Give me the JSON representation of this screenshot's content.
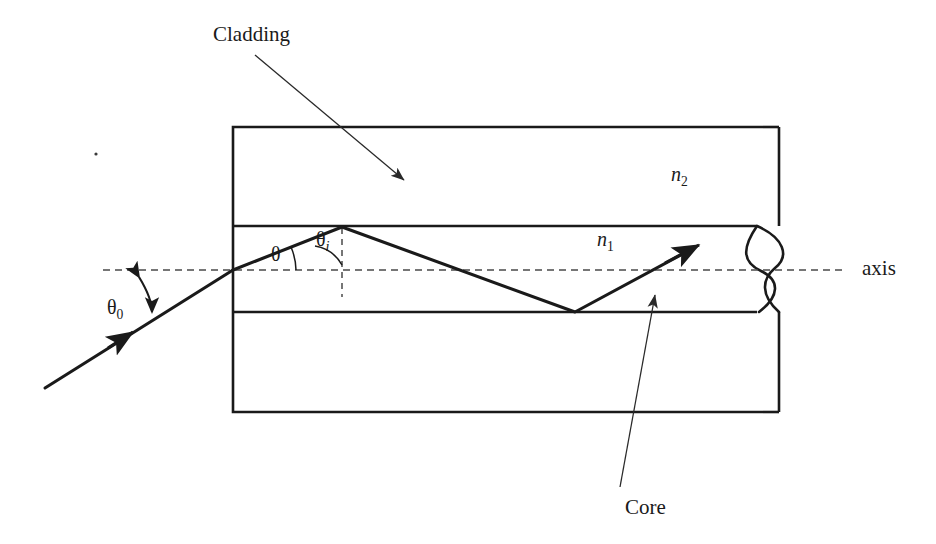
{
  "figure": {
    "type": "diagram",
    "background_color": "#ffffff",
    "line_color": "#1a1a1a",
    "dash_color": "#555555"
  },
  "labels": {
    "cladding": "Cladding",
    "core": "Core",
    "axis": "axis",
    "n2": "n",
    "n2_sub": "2",
    "n1": "n",
    "n1_sub": "1",
    "theta": "θ",
    "theta_i": "θ",
    "theta_i_sub": "i",
    "theta_0": "θ",
    "theta_0_sub": "0"
  },
  "geometry": {
    "cladding_rect": {
      "x": 233,
      "y": 127,
      "width": 703,
      "height": 285
    },
    "core_rect": {
      "x": 233,
      "y": 226,
      "width": 703,
      "height": 86
    },
    "axis_line": {
      "x1": 103,
      "y1": 270,
      "x2": 845,
      "y2": 270,
      "style": "dashed"
    },
    "normal_line": {
      "x1": 342,
      "y1": 228,
      "x2": 342,
      "y2": 297,
      "style": "dashed"
    },
    "incident_ray": {
      "x1": 45,
      "y1": 388,
      "x2": 233,
      "y2": 270
    },
    "ray_segment_1": {
      "x1": 233,
      "y1": 270,
      "x2": 342,
      "y2": 227
    },
    "ray_segment_2": {
      "x1": 342,
      "y1": 227,
      "x2": 575,
      "y2": 312
    },
    "ray_segment_3": {
      "x1": 575,
      "y1": 312,
      "x2": 700,
      "y2": 245
    },
    "break_symbol_x": 762,
    "entrance_face_x": 233
  },
  "leaders": {
    "cladding": {
      "x1": 255,
      "y1": 55,
      "x2": 410,
      "y2": 185
    },
    "core": {
      "x1": 652,
      "y1": 487,
      "x2": 655,
      "y2": 290
    }
  }
}
